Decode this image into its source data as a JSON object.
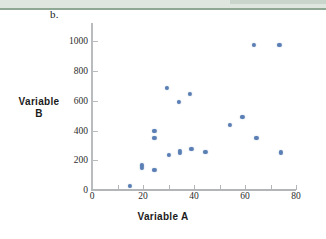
{
  "figure": {
    "part_label": "b.",
    "x_axis_title": "Variable A",
    "y_axis_title_line1": "Variable",
    "y_axis_title_line2": "B",
    "point_color": "#5b7fb4",
    "axis_color": "#b3b6b8"
  },
  "chart_data": {
    "type": "scatter",
    "title": "",
    "xlabel": "Variable A",
    "ylabel": "Variable B",
    "xlim": [
      0,
      85
    ],
    "ylim": [
      0,
      1080
    ],
    "xticks": [
      0,
      20,
      40,
      60,
      80
    ],
    "yticks": [
      0,
      200,
      400,
      600,
      800,
      1000
    ],
    "grid": false,
    "legend": false,
    "series": [
      {
        "name": "data",
        "color": "#5b7fb4",
        "points": [
          {
            "x": 15,
            "y": 25
          },
          {
            "x": 19.5,
            "y": 165
          },
          {
            "x": 19.5,
            "y": 150
          },
          {
            "x": 24.5,
            "y": 135
          },
          {
            "x": 24.5,
            "y": 398
          },
          {
            "x": 24.5,
            "y": 350
          },
          {
            "x": 29.5,
            "y": 685
          },
          {
            "x": 30,
            "y": 238
          },
          {
            "x": 34,
            "y": 592
          },
          {
            "x": 34.5,
            "y": 265
          },
          {
            "x": 34.5,
            "y": 252
          },
          {
            "x": 38.5,
            "y": 648
          },
          {
            "x": 39,
            "y": 278
          },
          {
            "x": 44.5,
            "y": 258
          },
          {
            "x": 54,
            "y": 440
          },
          {
            "x": 59,
            "y": 490
          },
          {
            "x": 63.5,
            "y": 978
          },
          {
            "x": 64.5,
            "y": 350
          },
          {
            "x": 73.5,
            "y": 975
          },
          {
            "x": 74,
            "y": 253
          }
        ]
      }
    ]
  }
}
